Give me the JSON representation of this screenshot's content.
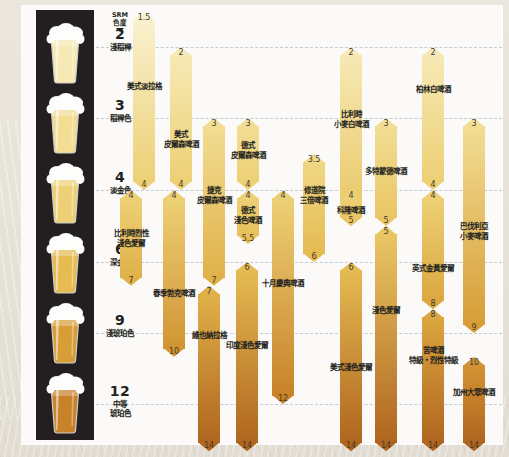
{
  "chart_data": {
    "type": "bar",
    "axis": {
      "name": "SRM 色度",
      "caret_icon": "caret-down-icon",
      "ticks": [
        {
          "value": 2,
          "label": "淺稻稈",
          "y": 47
        },
        {
          "value": 3,
          "label": "稻稈色",
          "y": 118
        },
        {
          "value": 4,
          "label": "淡金色",
          "y": 190
        },
        {
          "value": 6,
          "label": "深金色",
          "y": 262
        },
        {
          "value": 9,
          "label": "淺琥珀色",
          "y": 333
        },
        {
          "value": 12,
          "label": "中等\n琥珀色",
          "y": 404
        }
      ]
    },
    "glass_swatches": [
      {
        "srm": 2,
        "color": "#f6e9b4"
      },
      {
        "srm": 3,
        "color": "#f2dd93"
      },
      {
        "srm": 4,
        "color": "#edd075"
      },
      {
        "srm": 6,
        "color": "#e5bb52"
      },
      {
        "srm": 9,
        "color": "#d79d37"
      },
      {
        "srm": 12,
        "color": "#c8822a"
      }
    ],
    "ylim": [
      1.2,
      14.5
    ],
    "grid": true,
    "legend": "none",
    "xlabel": "",
    "ylabel": "SRM 色度",
    "series": [
      {
        "name": "美式淡拉格",
        "min": 1.5,
        "max": 4,
        "x": 133,
        "w": 22,
        "label_y": 82
      },
      {
        "name": "美式\n皮爾森啤酒",
        "min": 2,
        "max": 4,
        "x": 170,
        "w": 22,
        "label_y": 130
      },
      {
        "name": "捷克\n皮爾森啤酒",
        "min": 3,
        "max": 7,
        "x": 203,
        "w": 22,
        "label_y": 186
      },
      {
        "name": "德式\n皮爾森啤酒",
        "min": 3,
        "max": 4,
        "x": 237,
        "w": 22,
        "label_y": 141
      },
      {
        "name": "德式\n淺色啤酒",
        "min": 4,
        "max": 5.5,
        "x": 237,
        "w": 22,
        "label_y": 206
      },
      {
        "name": "修道院\n三倍啤酒",
        "min": 3.5,
        "max": 6,
        "x": 303,
        "w": 22,
        "label_y": 186
      },
      {
        "name": "比利時烈性\n淺色愛爾",
        "min": 4,
        "max": 7,
        "x": 120,
        "w": 22,
        "label_y": 229
      },
      {
        "name": "春季勃克啤酒",
        "min": 4,
        "max": 10,
        "x": 163,
        "w": 22,
        "label_y": 289
      },
      {
        "name": "維也納拉格",
        "min": 7,
        "max": 14,
        "x": 198,
        "w": 22,
        "label_y": 331
      },
      {
        "name": "十月慶典啤酒",
        "min": 4,
        "max": 12,
        "x": 272,
        "w": 22,
        "label_y": 279
      },
      {
        "name": "印度淺色愛爾",
        "min": 6,
        "max": 14,
        "x": 236,
        "w": 22,
        "label_y": 341
      },
      {
        "name": "比利時\n小麥白啤酒",
        "min": 2,
        "max": 5,
        "x": 340,
        "w": 22,
        "label_y": 110
      },
      {
        "name": "柏林白啤酒",
        "min": 2,
        "max": 4,
        "x": 422,
        "w": 22,
        "label_y": 85
      },
      {
        "name": "多特蒙德啤酒",
        "min": 3,
        "max": 5,
        "x": 375,
        "w": 22,
        "label_y": 167
      },
      {
        "name": "科隆啤酒",
        "min": 4,
        "max": 5,
        "x": 340,
        "w": 22,
        "label_y": 206
      },
      {
        "name": "巴伐利亞\n小麥啤酒",
        "min": 3,
        "max": 9,
        "x": 463,
        "w": 22,
        "label_y": 222
      },
      {
        "name": "英式金黃愛爾",
        "min": 4,
        "max": 8,
        "x": 422,
        "w": 22,
        "label_y": 264
      },
      {
        "name": "淺色愛爾",
        "min": 5,
        "max": 14,
        "x": 375,
        "w": 22,
        "label_y": 306
      },
      {
        "name": "美式淺色愛爾",
        "min": 6,
        "max": 14,
        "x": 340,
        "w": 22,
        "label_y": 363
      },
      {
        "name": "苦啤酒\n特級・烈性特級",
        "min": 8,
        "max": 14,
        "x": 422,
        "w": 22,
        "label_y": 346
      },
      {
        "name": "加州大眾啤酒",
        "min": 10,
        "max": 14,
        "x": 463,
        "w": 22,
        "label_y": 388
      }
    ]
  },
  "labels": {
    "srm_header_line1": "SRM",
    "srm_header_line2": "色度"
  }
}
